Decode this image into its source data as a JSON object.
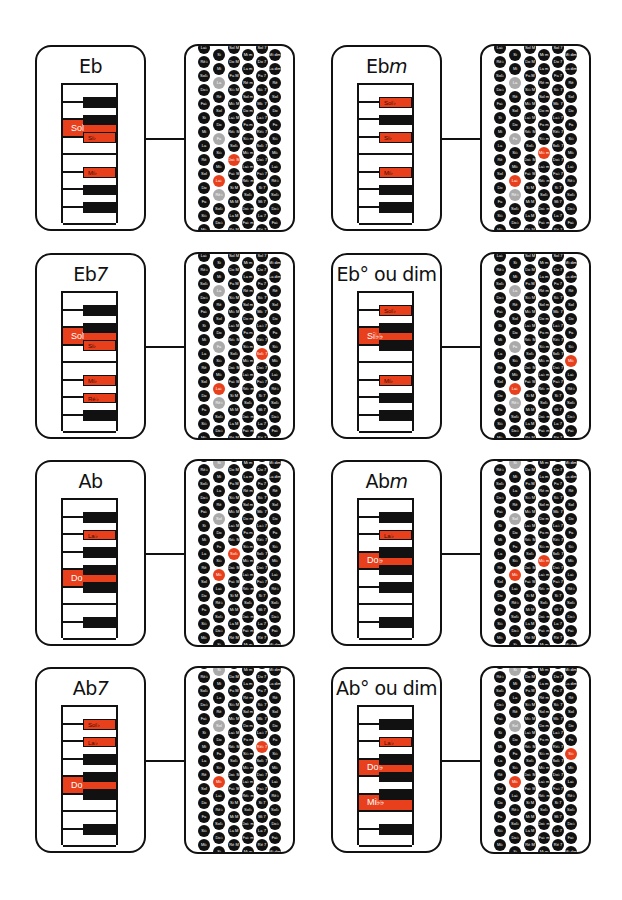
{
  "colors": {
    "highlight": "#e8401c",
    "black_key": "#111111",
    "root_marker": "#aaaaaa",
    "button": "#111111"
  },
  "accordion_columns": [
    "counterbass",
    "bass",
    "major",
    "minor",
    "seventh",
    "diminished"
  ],
  "panels": [
    {
      "title": "Eb",
      "title_suffix": "",
      "col": 0,
      "row": 0,
      "keys": [
        {
          "type": "white"
        },
        {
          "type": "black",
          "hl": false,
          "pos": 1
        },
        {
          "type": "white",
          "hl": true,
          "label": "Sol",
          "big": true
        },
        {
          "type": "black",
          "hl": false,
          "pos": 2
        },
        {
          "type": "white"
        },
        {
          "type": "black",
          "hl": true,
          "pos": 3,
          "label": "Si♭"
        },
        {
          "type": "white"
        },
        {
          "type": "white"
        },
        {
          "type": "black",
          "hl": true,
          "pos": 5,
          "label": "Mi♭"
        },
        {
          "type": "white"
        },
        {
          "type": "black",
          "hl": false,
          "pos": 6
        },
        {
          "type": "white"
        },
        {
          "type": "black",
          "hl": false,
          "pos": 7
        }
      ],
      "accordion": {
        "highlight": [
          [
            1,
            9
          ],
          [
            2,
            8
          ]
        ],
        "root": [
          [
            1,
            2
          ],
          [
            1,
            6
          ],
          [
            1,
            10
          ]
        ]
      }
    },
    {
      "title": "Eb",
      "title_suffix": "m",
      "col": 1,
      "row": 0,
      "accordion": {
        "highlight": [
          [
            1,
            9
          ],
          [
            3,
            7
          ]
        ],
        "root": [
          [
            1,
            2
          ],
          [
            1,
            6
          ],
          [
            1,
            10
          ]
        ]
      }
    },
    {
      "title": "Eb",
      "title_suffix": "7",
      "col": 0,
      "row": 1,
      "accordion": {
        "highlight": [
          [
            1,
            9
          ],
          [
            4,
            7
          ]
        ],
        "root": [
          [
            1,
            2
          ],
          [
            1,
            6
          ],
          [
            1,
            10
          ]
        ]
      }
    },
    {
      "title": "Eb° ou dim",
      "title_suffix": "",
      "col": 1,
      "row": 1,
      "accordion": {
        "highlight": [
          [
            1,
            9
          ],
          [
            5,
            7
          ]
        ],
        "root": [
          [
            1,
            2
          ],
          [
            1,
            6
          ],
          [
            1,
            10
          ]
        ]
      }
    },
    {
      "title": "Ab",
      "title_suffix": "",
      "col": 0,
      "row": 2,
      "accordion": {
        "highlight": [
          [
            1,
            8
          ],
          [
            2,
            7
          ]
        ],
        "root": [
          [
            1,
            0
          ],
          [
            1,
            4
          ]
        ]
      }
    },
    {
      "title": "Ab",
      "title_suffix": "m",
      "col": 1,
      "row": 2,
      "accordion": {
        "highlight": [
          [
            1,
            8
          ],
          [
            3,
            7
          ]
        ],
        "root": [
          [
            1,
            0
          ],
          [
            1,
            4
          ]
        ]
      }
    },
    {
      "title": "Ab",
      "title_suffix": "7",
      "col": 0,
      "row": 3,
      "accordion": {
        "highlight": [
          [
            1,
            8
          ],
          [
            4,
            6
          ]
        ],
        "root": [
          [
            1,
            0
          ],
          [
            1,
            4
          ]
        ]
      }
    },
    {
      "title": "Ab° ou dim",
      "title_suffix": "",
      "col": 1,
      "row": 3,
      "accordion": {
        "highlight": [
          [
            1,
            8
          ],
          [
            5,
            6
          ]
        ],
        "root": [
          [
            1,
            0
          ],
          [
            1,
            4
          ]
        ]
      }
    }
  ],
  "keyboards": [
    [
      {
        "row": 2,
        "kind": "white",
        "label": "Sol"
      },
      {
        "row": 3,
        "kind": "black",
        "label": "Si♭"
      },
      {
        "row": 5,
        "kind": "black",
        "label": "Mi♭"
      }
    ],
    [
      {
        "row": 1,
        "kind": "black",
        "label": "Sol♭"
      },
      {
        "row": 3,
        "kind": "black",
        "label": "Si♭"
      },
      {
        "row": 5,
        "kind": "black",
        "label": "Mi♭"
      }
    ],
    [
      {
        "row": 2,
        "kind": "white",
        "label": "Sol"
      },
      {
        "row": 3,
        "kind": "black",
        "label": "Si♭"
      },
      {
        "row": 5,
        "kind": "black",
        "label": "Mi♭"
      },
      {
        "row": 6,
        "kind": "black",
        "label": "Ré♭"
      }
    ],
    [
      {
        "row": 1,
        "kind": "black",
        "label": "Sol♭"
      },
      {
        "row": 2,
        "kind": "white",
        "label": "Si♭♭"
      },
      {
        "row": 5,
        "kind": "black",
        "label": "Mi♭"
      }
    ],
    [
      {
        "row": 2,
        "kind": "black",
        "label": "La♭"
      },
      {
        "row": 4,
        "kind": "white",
        "label": "Do"
      },
      {
        "row": 6,
        "kind": "black",
        "label": "Mi♭"
      }
    ],
    [
      {
        "row": 2,
        "kind": "black",
        "label": "La♭"
      },
      {
        "row": 3,
        "kind": "white",
        "label": "Do♭"
      },
      {
        "row": 6,
        "kind": "black",
        "label": "Mi♭"
      }
    ],
    [
      {
        "row": 1,
        "kind": "black",
        "label": "Sol♭"
      },
      {
        "row": 2,
        "kind": "black",
        "label": "La♭"
      },
      {
        "row": 4,
        "kind": "white",
        "label": "Do"
      },
      {
        "row": 6,
        "kind": "black",
        "label": "Mi♭"
      }
    ],
    [
      {
        "row": 2,
        "kind": "black",
        "label": "La♭"
      },
      {
        "row": 3,
        "kind": "white",
        "label": "Do♭"
      },
      {
        "row": 5,
        "kind": "white",
        "label": "Mi♭♭"
      }
    ]
  ],
  "keyboard_black_rows": [
    [
      1,
      2,
      3,
      5,
      6,
      7
    ],
    [
      1,
      2,
      3,
      5,
      6,
      7
    ],
    [
      1,
      2,
      3,
      5,
      6,
      7
    ],
    [
      1,
      2,
      3,
      5,
      6,
      7
    ],
    [
      1,
      2,
      3,
      4,
      5,
      7
    ],
    [
      1,
      2,
      3,
      4,
      5,
      7
    ],
    [
      1,
      2,
      3,
      4,
      5,
      7
    ],
    [
      1,
      2,
      3,
      4,
      5,
      7
    ]
  ],
  "accordion_labels": {
    "col0": [
      "La♭",
      "Ré♭",
      "Sol♭",
      "Do♭",
      "Fa♭",
      "Si",
      "Mi",
      "La",
      "Ré",
      "Sol",
      "Do",
      "Fa",
      "Si♭",
      "Mi♭"
    ],
    "col1": [
      "Si",
      "Mi",
      "La",
      "Ré",
      "Sol",
      "Do",
      "Fa",
      "Si♭",
      "Mi♭",
      "La♭",
      "Ré♭",
      "Sol♭",
      "Do♭"
    ],
    "col2": [
      "Sol M",
      "Do M",
      "Fa M",
      "Si♭ M",
      "Mi♭ M",
      "La♭ M",
      "Ré♭ M",
      "Sol♭ M",
      "Do♭ M",
      "Fa♭ M",
      "Si M",
      "Mi M",
      "La M",
      "Ré M"
    ],
    "col3": [
      "Mi m",
      "La m",
      "Ré m",
      "Sol m",
      "Do m",
      "Fa m",
      "Si♭ m",
      "Mi♭ m",
      "La♭ m",
      "Ré♭ m",
      "Sol♭ m",
      "Do♭ m",
      "Fa♭ m"
    ],
    "col4": [
      "Sol 7",
      "Do 7",
      "Fa 7",
      "Si♭ 7",
      "Mi♭ 7",
      "La♭ 7",
      "Ré♭ 7",
      "Sol♭ 7",
      "Do♭ 7",
      "Fa♭ 7",
      "Si 7",
      "Mi 7",
      "La 7",
      "Ré 7"
    ],
    "col5": [
      "Mi dim",
      "La dim",
      "Ré dim",
      "Sol dim",
      "Do dim",
      "Fa dim",
      "Si♭ dim",
      "Mi♭ dim",
      "La♭ dim",
      "Ré♭ dim",
      "Sol♭ dim",
      "Do♭ dim",
      "Fa♭ dim"
    ]
  }
}
